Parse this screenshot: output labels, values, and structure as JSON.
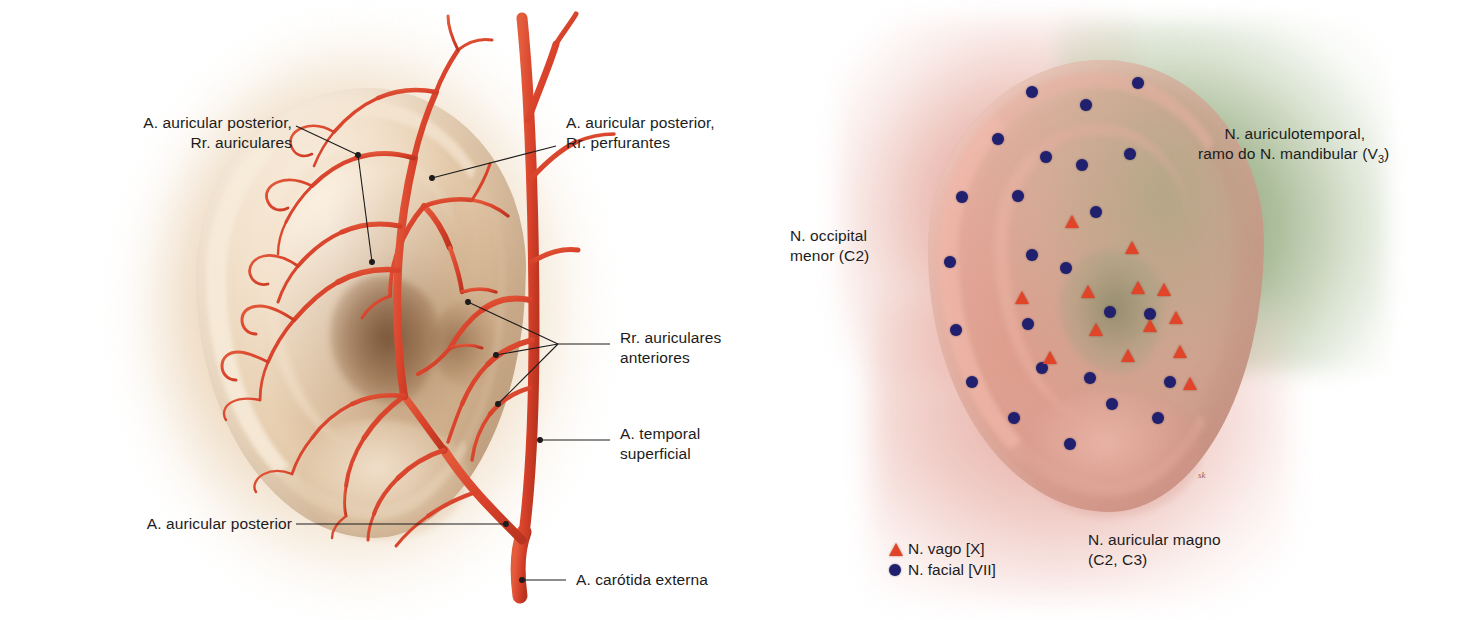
{
  "figures": {
    "arteries": {
      "name": "arterial-supply-of-auricle",
      "labels": {
        "auricular_posterior_rr_auriculares": "A. auricular posterior,\nRr. auriculares",
        "auricular_posterior_rr_perfurantes": "A. auricular posterior,\nRr. perfurantes",
        "rr_auriculares_anteriores": "Rr. auriculares\nanteriores",
        "temporal_superficial": "A. temporal\nsuperficial",
        "auricular_posterior": "A. auricular posterior",
        "carotida_externa": "A. carótida externa"
      },
      "colors": {
        "artery": "#d8412a",
        "skin": "#e8d0b2",
        "shadow": "#7a5230",
        "leader": "#1c1c1c"
      }
    },
    "nerves": {
      "name": "sensory-innervation-of-auricle",
      "labels": {
        "auriculotemporal": "N. auriculotemporal,\nramo do N. mandibular (V",
        "auriculotemporal_sub": "3",
        "auriculotemporal_end": ")",
        "occipital_menor": "N. occipital\nmenor (C2)",
        "auricular_magno": "N. auricular magno\n(C2, C3)"
      },
      "legend": [
        {
          "marker": "triangle",
          "color": "#e0452a",
          "text": "N. vago [X]"
        },
        {
          "marker": "circle",
          "color": "#20206e",
          "text": "N. facial [VII]"
        }
      ],
      "signature": "sk",
      "colors": {
        "green_territory": "#8ea673",
        "pink_territory": "#d98c7e",
        "vagus_marker": "#e0452a",
        "facial_marker": "#20206e"
      },
      "facial_markers": [
        {
          "x": 272,
          "y": 92
        },
        {
          "x": 326,
          "y": 105
        },
        {
          "x": 378,
          "y": 83
        },
        {
          "x": 238,
          "y": 139
        },
        {
          "x": 286,
          "y": 157
        },
        {
          "x": 322,
          "y": 165
        },
        {
          "x": 370,
          "y": 154
        },
        {
          "x": 202,
          "y": 197
        },
        {
          "x": 258,
          "y": 196
        },
        {
          "x": 336,
          "y": 212
        },
        {
          "x": 190,
          "y": 262
        },
        {
          "x": 272,
          "y": 255
        },
        {
          "x": 306,
          "y": 268
        },
        {
          "x": 196,
          "y": 330
        },
        {
          "x": 268,
          "y": 324
        },
        {
          "x": 350,
          "y": 312
        },
        {
          "x": 390,
          "y": 314
        },
        {
          "x": 212,
          "y": 382
        },
        {
          "x": 282,
          "y": 368
        },
        {
          "x": 330,
          "y": 378
        },
        {
          "x": 410,
          "y": 382
        },
        {
          "x": 254,
          "y": 418
        },
        {
          "x": 352,
          "y": 404
        },
        {
          "x": 398,
          "y": 418
        },
        {
          "x": 310,
          "y": 444
        }
      ],
      "vagus_markers": [
        {
          "x": 312,
          "y": 222
        },
        {
          "x": 372,
          "y": 248
        },
        {
          "x": 262,
          "y": 298
        },
        {
          "x": 328,
          "y": 292
        },
        {
          "x": 378,
          "y": 288
        },
        {
          "x": 404,
          "y": 290
        },
        {
          "x": 336,
          "y": 330
        },
        {
          "x": 390,
          "y": 326
        },
        {
          "x": 416,
          "y": 318
        },
        {
          "x": 290,
          "y": 358
        },
        {
          "x": 368,
          "y": 356
        },
        {
          "x": 420,
          "y": 352
        },
        {
          "x": 430,
          "y": 384
        }
      ]
    }
  }
}
